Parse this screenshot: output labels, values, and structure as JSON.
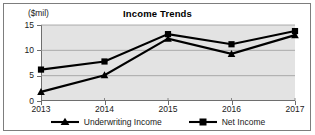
{
  "chart_data": {
    "type": "line",
    "title": "Income Trends",
    "xlabel": "",
    "ylabel": "($mil)",
    "categories": [
      "2013",
      "2014",
      "2015",
      "2016",
      "2017"
    ],
    "x": [
      2013,
      2014,
      2015,
      2016,
      2017
    ],
    "ylim": [
      0,
      15
    ],
    "yticks": [
      0,
      5,
      10,
      15
    ],
    "ytick_labels": [
      "0",
      "5",
      "10",
      "15"
    ],
    "grid": true,
    "grid_axis": "y",
    "legend_position": "bottom",
    "series": [
      {
        "name": "Underwriting Income",
        "marker": "triangle",
        "color": "#000000",
        "values": [
          1.8,
          5.1,
          12.3,
          9.3,
          13.0
        ]
      },
      {
        "name": "Net Income",
        "marker": "square",
        "color": "#000000",
        "values": [
          6.2,
          7.8,
          13.2,
          11.2,
          13.8
        ]
      }
    ]
  },
  "colors": {
    "plot_background": "#e3e3e3",
    "frame": "#7d7d7d",
    "axis": "#6e6e6e",
    "gridline": "#9a9a9a",
    "series_line": "#000000",
    "text": "#1a1a1a"
  }
}
